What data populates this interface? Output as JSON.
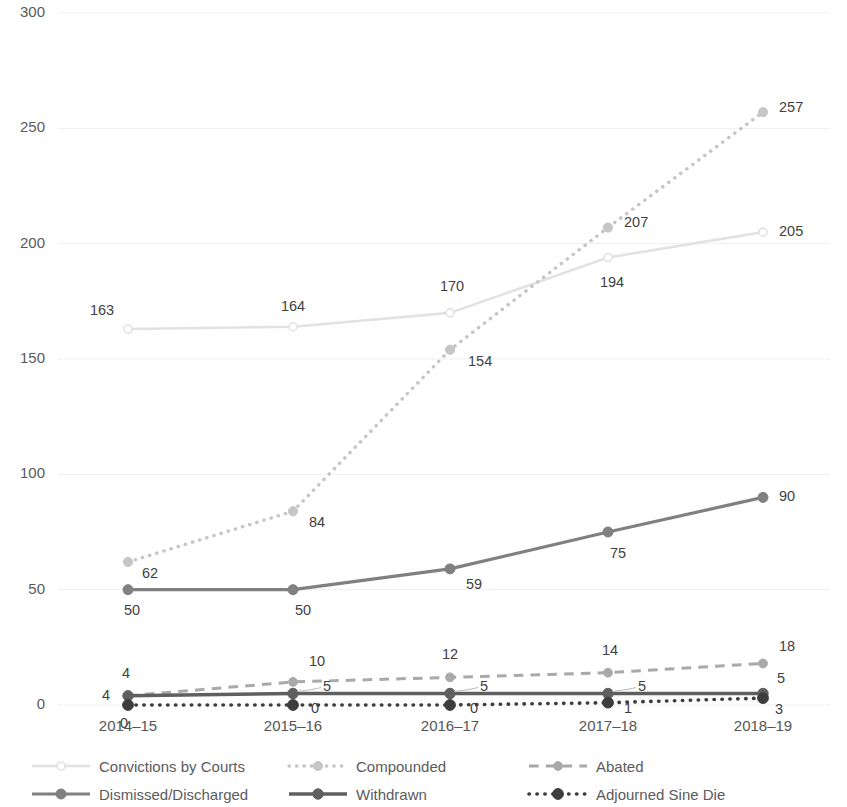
{
  "chart_data": {
    "type": "line",
    "title": "",
    "xlabel": "",
    "ylabel": "",
    "categories": [
      "2014–15",
      "2015–16",
      "2016–17",
      "2017–18",
      "2018–19"
    ],
    "ylim": [
      0,
      300
    ],
    "yticks": [
      0,
      50,
      100,
      150,
      200,
      250,
      300
    ],
    "ytick_labels": [
      "0",
      "50",
      "100",
      "150",
      "200",
      "250",
      "300"
    ],
    "grid": true,
    "legend_position": "bottom",
    "series": [
      {
        "name": "Convictions by Courts",
        "values": [
          163,
          164,
          170,
          194,
          205
        ],
        "labels": [
          "163",
          "164",
          "170",
          "194",
          "205"
        ],
        "color": "#e2e2e2",
        "line_style": "solid",
        "marker": "circle-open"
      },
      {
        "name": "Compounded",
        "values": [
          62,
          84,
          154,
          207,
          257
        ],
        "labels": [
          "62",
          "84",
          "154",
          "207",
          "257"
        ],
        "color": "#c6c6c6",
        "line_style": "dotted",
        "marker": "circle"
      },
      {
        "name": "Abated",
        "values": [
          4,
          10,
          12,
          14,
          18
        ],
        "labels": [
          "4",
          "10",
          "12",
          "14",
          "18"
        ],
        "color": "#a9a9a9",
        "line_style": "dashed",
        "marker": "circle"
      },
      {
        "name": "Dismissed/Discharged",
        "values": [
          50,
          50,
          59,
          75,
          90
        ],
        "labels": [
          "50",
          "50",
          "59",
          "75",
          "90"
        ],
        "color": "#808080",
        "line_style": "solid",
        "marker": "circle"
      },
      {
        "name": "Withdrawn",
        "values": [
          4,
          5,
          5,
          5,
          5
        ],
        "labels": [
          "4",
          "5",
          "5",
          "5",
          "5"
        ],
        "color": "#5f5f5f",
        "line_style": "solid",
        "marker": "circle"
      },
      {
        "name": "Adjourned Sine Die",
        "values": [
          0,
          0,
          0,
          1,
          3
        ],
        "labels": [
          "0",
          "0",
          "0",
          "1",
          "3"
        ],
        "color": "#3d3d3d",
        "line_style": "dotted",
        "marker": "circle"
      }
    ]
  },
  "legend": {
    "items": [
      {
        "label": "Convictions by Courts"
      },
      {
        "label": "Compounded"
      },
      {
        "label": "Abated"
      },
      {
        "label": "Dismissed/Discharged"
      },
      {
        "label": "Withdrawn"
      },
      {
        "label": "Adjourned Sine Die"
      }
    ]
  }
}
